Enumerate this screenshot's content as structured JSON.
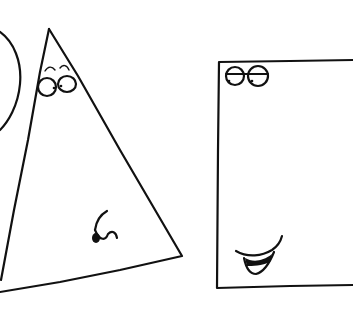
{
  "scene": {
    "description": "Hand-drawn line sketch of three geometric characters",
    "background": "#ffffff",
    "ink_color": "#111111",
    "characters": [
      {
        "shape": "circle",
        "visible": "partial, cut off at left edge",
        "face": false
      },
      {
        "shape": "triangle",
        "face": true,
        "features": [
          "raised-eyebrows",
          "round-eyes",
          "pursed-mouth"
        ]
      },
      {
        "shape": "rectangle",
        "visible": "partial, cut off at right edge",
        "face": true,
        "features": [
          "half-lidded-eyes",
          "smirk-mouth"
        ]
      }
    ]
  }
}
